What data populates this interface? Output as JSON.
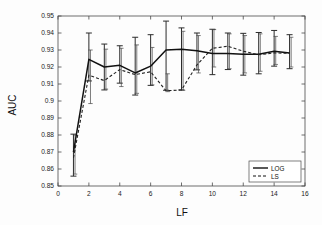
{
  "figure": {
    "title": "",
    "y_axis_label": "AUC",
    "x_axis_label": "LF"
  },
  "legend": {
    "position": "bottom-right",
    "entries": [
      {
        "label": "LOG",
        "style": "solid"
      },
      {
        "label": "LS",
        "style": "dashed"
      }
    ]
  },
  "axis": {
    "x_ticks": [
      "0",
      "2",
      "4",
      "6",
      "8",
      "10",
      "12",
      "14",
      "16"
    ],
    "y_ticks": [
      "0.85",
      "0.86",
      "0.87",
      "0.88",
      "0.89",
      "0.9",
      "0.91",
      "0.92",
      "0.93",
      "0.94",
      "0.95"
    ]
  },
  "chart_data": {
    "type": "line",
    "title": "",
    "xlabel": "LF",
    "ylabel": "AUC",
    "xlim": [
      0,
      16
    ],
    "ylim": [
      0.85,
      0.95
    ],
    "xticks": [
      0,
      2,
      4,
      6,
      8,
      10,
      12,
      14,
      16
    ],
    "yticks": [
      0.85,
      0.86,
      0.87,
      0.88,
      0.89,
      0.9,
      0.91,
      0.92,
      0.93,
      0.94,
      0.95
    ],
    "grid": false,
    "legend_position": "lower right",
    "x": [
      1,
      2,
      3,
      4,
      5,
      6,
      7,
      8,
      9,
      10,
      11,
      12,
      13,
      14,
      15
    ],
    "series": [
      {
        "name": "LOG",
        "style": "solid",
        "color": "#111111",
        "values": [
          0.87,
          0.9245,
          0.92,
          0.921,
          0.9165,
          0.9205,
          0.93,
          0.9305,
          0.9295,
          0.928,
          0.928,
          0.9275,
          0.9275,
          0.9293,
          0.9282
        ],
        "error_upper": [
          0.8805,
          0.94,
          0.9335,
          0.9325,
          0.9375,
          0.939,
          0.947,
          0.943,
          0.94,
          0.9422,
          0.94,
          0.9398,
          0.9403,
          0.9415,
          0.939
        ],
        "error_lower": [
          0.8558,
          0.9118,
          0.9065,
          0.9105,
          0.9035,
          0.9092,
          0.9063,
          0.9065,
          0.9183,
          0.9155,
          0.9185,
          0.9152,
          0.916,
          0.9205,
          0.919
        ]
      },
      {
        "name": "LS",
        "style": "dashed",
        "color": "#222222",
        "values": [
          0.8665,
          0.9152,
          0.912,
          0.9185,
          0.9155,
          0.9172,
          0.906,
          0.9065,
          0.9212,
          0.931,
          0.9322,
          0.9293,
          0.9272,
          0.9283,
          0.928
        ],
        "error_upper": [
          0.88,
          0.93,
          0.9305,
          0.931,
          0.933,
          0.9315,
          0.916,
          0.941,
          0.9385,
          0.942,
          0.9395,
          0.9385,
          0.9395,
          0.938,
          0.9375
        ],
        "error_lower": [
          0.857,
          0.8985,
          0.907,
          0.9085,
          0.9045,
          0.9095,
          0.9055,
          0.9063,
          0.9165,
          0.92,
          0.919,
          0.9165,
          0.9175,
          0.9215,
          0.92
        ]
      }
    ]
  }
}
